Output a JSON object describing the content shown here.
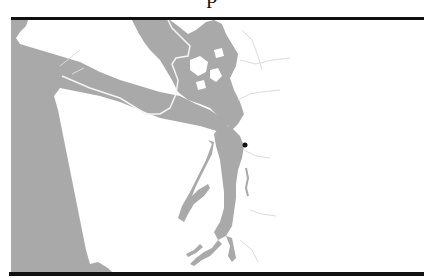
{
  "title_fragment": "p",
  "map": {
    "region": "Puget Sound / Salish Sea",
    "colors": {
      "water": "#a9a9a9",
      "land": "#ffffff",
      "boundary": "#f2f2f2",
      "rivers": "#dcdcdc",
      "marker": "#111111",
      "frame": "#111111"
    },
    "marker": {
      "label": "",
      "x": 245,
      "y": 145
    }
  }
}
